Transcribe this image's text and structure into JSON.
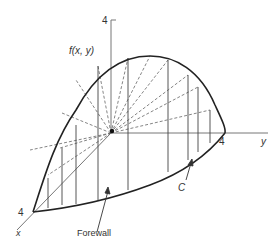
{
  "diagram": {
    "axis_labels": {
      "z_tick": "4",
      "function": "f(x, y)",
      "y_tick": "4",
      "y_axis": "y",
      "x_tick": "4",
      "x_axis": "x"
    },
    "annotations": {
      "forewall": "Forewall",
      "curve": "C"
    },
    "colors": {
      "ink": "#222222",
      "axis": "#777777",
      "dashed": "#666666"
    }
  }
}
